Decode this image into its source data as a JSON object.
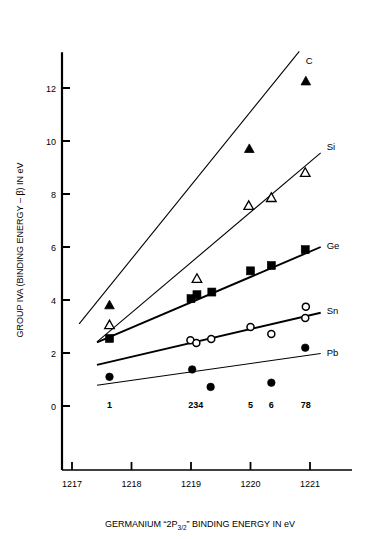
{
  "figure": {
    "axis_titles": {
      "y": "GROUP IVA (BINDING ENERGY – β) IN eV",
      "x_pre": "GERMANIUM “2P",
      "x_sub": "3/2",
      "x_post": "” BINDING ENERGY IN eV"
    },
    "x_ticks": [
      "1217",
      "1218",
      "1219",
      "1220",
      "1221"
    ],
    "y_ticks": [
      "0",
      "2",
      "4",
      "6",
      "8",
      "10",
      "12"
    ],
    "point_labels": [
      {
        "text": "1",
        "x": 1217.63
      },
      {
        "text": "234",
        "x": 1219.08
      },
      {
        "text": "5",
        "x": 1220.0
      },
      {
        "text": "6",
        "x": 1220.35
      },
      {
        "text": "78",
        "x": 1220.93
      }
    ]
  },
  "chart_data": {
    "type": "scatter",
    "title": "",
    "xlabel": "GERMANIUM “2P3/2” BINDING ENERGY IN eV",
    "ylabel": "GROUP IVA (BINDING ENERGY – β) IN eV",
    "xlim": [
      1216.75,
      1221.6
    ],
    "ylim": [
      -0.95,
      13.4
    ],
    "xticks": [
      1217,
      1218,
      1219,
      1220,
      1221
    ],
    "yticks": [
      0,
      2,
      4,
      6,
      8,
      10,
      12
    ],
    "grid": false,
    "legend": "inline-right-of-each-line",
    "series": [
      {
        "name": "C",
        "marker": "filled-triangle",
        "label": "C",
        "label_xy": [
          1220.93,
          13.05
        ],
        "points": [
          {
            "compound": 1,
            "x": 1217.63,
            "y": 3.8
          },
          {
            "compound": 5,
            "x": 1219.98,
            "y": 9.7
          },
          {
            "compound": 78,
            "x": 1220.93,
            "y": 12.25
          }
        ],
        "fit_line": {
          "x1": 1217.12,
          "y1": 3.1,
          "x2": 1220.82,
          "y2": 13.38
        }
      },
      {
        "name": "Si",
        "marker": "open-triangle",
        "label": "Si",
        "label_xy": [
          1221.28,
          9.8
        ],
        "points": [
          {
            "compound": 1,
            "x": 1217.63,
            "y": 3.05
          },
          {
            "compound": 234,
            "x": 1219.1,
            "y": 4.8
          },
          {
            "compound": 5,
            "x": 1219.97,
            "y": 7.55
          },
          {
            "compound": 6,
            "x": 1220.35,
            "y": 7.85
          },
          {
            "compound": 78,
            "x": 1220.92,
            "y": 8.8
          }
        ],
        "fit_line": {
          "x1": 1217.42,
          "y1": 2.42,
          "x2": 1221.18,
          "y2": 9.55
        }
      },
      {
        "name": "Ge",
        "marker": "filled-square",
        "label": "Ge",
        "label_xy": [
          1221.28,
          6.05
        ],
        "points": [
          {
            "compound": 1,
            "x": 1217.63,
            "y": 2.55
          },
          {
            "compound": 2,
            "x": 1219.0,
            "y": 4.05
          },
          {
            "compound": 3,
            "x": 1219.1,
            "y": 4.2
          },
          {
            "compound": 4,
            "x": 1219.35,
            "y": 4.3
          },
          {
            "compound": 5,
            "x": 1220.0,
            "y": 5.1
          },
          {
            "compound": 6,
            "x": 1220.35,
            "y": 5.3
          },
          {
            "compound": 78,
            "x": 1220.92,
            "y": 5.9
          }
        ],
        "fit_line": {
          "x1": 1217.42,
          "y1": 2.4,
          "x2": 1221.18,
          "y2": 6.0
        }
      },
      {
        "name": "Sn",
        "marker": "open-circle",
        "label": "Sn",
        "label_xy": [
          1221.28,
          3.6
        ],
        "points": [
          {
            "compound": 2,
            "x": 1218.99,
            "y": 2.48
          },
          {
            "compound": 3,
            "x": 1219.09,
            "y": 2.38
          },
          {
            "compound": 4,
            "x": 1219.34,
            "y": 2.53
          },
          {
            "compound": 5,
            "x": 1220.0,
            "y": 2.98
          },
          {
            "compound": 6,
            "x": 1220.35,
            "y": 2.72
          },
          {
            "compound": 7,
            "x": 1220.92,
            "y": 3.32
          },
          {
            "compound": 8,
            "x": 1220.93,
            "y": 3.75
          }
        ],
        "fit_line": {
          "x1": 1217.42,
          "y1": 1.55,
          "x2": 1221.18,
          "y2": 3.52
        }
      },
      {
        "name": "Pb",
        "marker": "filled-circle",
        "label": "Pb",
        "label_xy": [
          1221.28,
          2.02
        ],
        "points": [
          {
            "compound": 1,
            "x": 1217.63,
            "y": 1.1
          },
          {
            "compound": 234,
            "x": 1219.02,
            "y": 1.38
          },
          {
            "compound": 4,
            "x": 1219.33,
            "y": 0.72
          },
          {
            "compound": 6,
            "x": 1220.35,
            "y": 0.88
          },
          {
            "compound": 78,
            "x": 1220.92,
            "y": 2.2
          }
        ],
        "fit_line": {
          "x1": 1217.42,
          "y1": 0.78,
          "x2": 1221.18,
          "y2": 1.98
        }
      }
    ]
  }
}
